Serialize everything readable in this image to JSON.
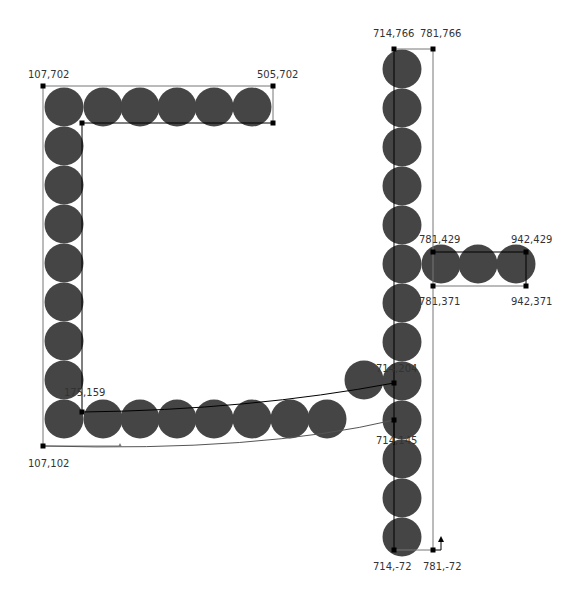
{
  "colors": {
    "circle": "#454545",
    "line": "#000000",
    "frame": "#777777",
    "handle": "#000000",
    "label": "#333333",
    "background": "#ffffff"
  },
  "labels": [
    {
      "id": "tl-top",
      "text": "107,702",
      "x": 28,
      "y": 78
    },
    {
      "id": "tr-top",
      "text": "505,702",
      "x": 257,
      "y": 78
    },
    {
      "id": "col-tl",
      "text": "714,766",
      "x": 373,
      "y": 37
    },
    {
      "id": "col-tr",
      "text": "781,766",
      "x": 420,
      "y": 37
    },
    {
      "id": "arm-tl",
      "text": "781,429",
      "x": 419,
      "y": 243
    },
    {
      "id": "arm-tr",
      "text": "942,429",
      "x": 511,
      "y": 243
    },
    {
      "id": "arm-bl",
      "text": "781,371",
      "x": 419,
      "y": 305
    },
    {
      "id": "arm-br",
      "text": "942,371",
      "x": 511,
      "y": 305
    },
    {
      "id": "arc-top",
      "text": "714,204",
      "x": 376,
      "y": 372
    },
    {
      "id": "arc-bottom",
      "text": "714,145",
      "x": 376,
      "y": 444
    },
    {
      "id": "inner-corner",
      "text": "175,159",
      "x": 64,
      "y": 396
    },
    {
      "id": "bl-bottom",
      "text": "107,102",
      "x": 28,
      "y": 467
    },
    {
      "id": "col-bl",
      "text": "714,-72",
      "x": 373,
      "y": 570
    },
    {
      "id": "col-br",
      "text": "781,-72",
      "x": 423,
      "y": 570
    }
  ],
  "circles": {
    "radius": 19.5,
    "top_row": {
      "y": 107,
      "x": [
        64,
        103,
        140,
        177,
        214,
        252
      ]
    },
    "left_column": {
      "x": 64,
      "y": [
        146,
        185,
        224,
        263,
        302,
        341,
        380,
        419
      ]
    },
    "bottom_row": {
      "y": 419,
      "x": [
        103,
        140,
        177,
        214,
        252,
        290,
        327
      ]
    },
    "stray": [
      {
        "x": 364,
        "y": 380
      }
    ],
    "right_column": {
      "x": 402,
      "y": [
        69,
        108,
        147,
        186,
        225,
        264,
        303,
        342,
        381,
        420,
        459,
        498,
        537
      ]
    },
    "arm_row": {
      "y": 264,
      "x": [
        441,
        478,
        516
      ]
    }
  },
  "handles": [
    {
      "x": 43,
      "y": 86
    },
    {
      "x": 273,
      "y": 86
    },
    {
      "x": 273,
      "y": 123
    },
    {
      "x": 82,
      "y": 123
    },
    {
      "x": 82,
      "y": 412
    },
    {
      "x": 43,
      "y": 446
    },
    {
      "x": 394,
      "y": 49
    },
    {
      "x": 433,
      "y": 49
    },
    {
      "x": 433,
      "y": 252
    },
    {
      "x": 526,
      "y": 252
    },
    {
      "x": 526,
      "y": 286
    },
    {
      "x": 433,
      "y": 286
    },
    {
      "x": 394,
      "y": 383
    },
    {
      "x": 394,
      "y": 420
    },
    {
      "x": 394,
      "y": 550
    },
    {
      "x": 433,
      "y": 550
    }
  ]
}
